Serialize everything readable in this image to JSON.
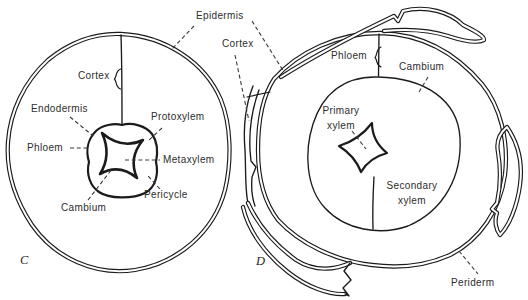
{
  "figure": {
    "colors": {
      "background": "#ffffff",
      "ink": "#1b1b1b",
      "label_text": "#2d2d2d"
    },
    "shared_labels": {
      "epidermis": "Epidermis"
    },
    "panel_c": {
      "caption": "C",
      "labels": {
        "cortex": "Cortex",
        "endodermis": "Endodermis",
        "phloem": "Phloem",
        "protoxylem": "Protoxylem",
        "metaxylem": "Metaxylem",
        "pericycle": "Pericycle",
        "cambium": "Cambium"
      }
    },
    "panel_d": {
      "caption": "D",
      "labels": {
        "cortex": "Cortex",
        "phloem": "Phloem",
        "cambium": "Cambium",
        "primary_xylem": {
          "line1": "Primary",
          "line2": "xylem"
        },
        "secondary_xylem": {
          "line1": "Secondary",
          "line2": "xylem"
        },
        "periderm": "Periderm"
      }
    }
  }
}
